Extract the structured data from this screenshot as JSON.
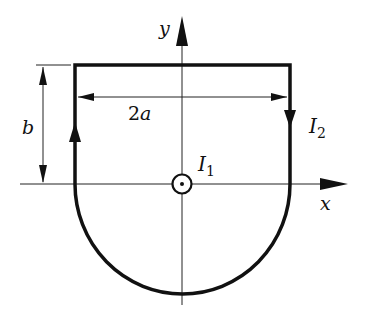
{
  "diagram": {
    "axes": {
      "x_label": "x",
      "y_label": "y"
    },
    "dimensions": {
      "height_label": "b",
      "width_prefix": "2",
      "width_var": "a"
    },
    "currents": {
      "wire": {
        "symbol": "I",
        "subscript": "1",
        "direction": "out-of-page"
      },
      "loop": {
        "symbol": "I",
        "subscript": "2",
        "direction": "clockwise"
      }
    },
    "colors": {
      "stroke": "#111111",
      "background": "#ffffff"
    }
  }
}
